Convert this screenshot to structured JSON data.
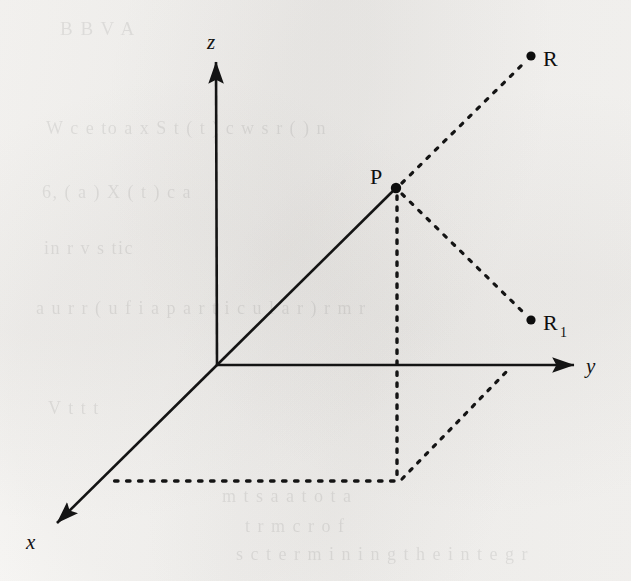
{
  "figure": {
    "background_color": "#f7f6f4",
    "ink_color": "#141414",
    "width": 631,
    "height": 581
  },
  "axes": [
    {
      "id": "z-axis",
      "label": "z",
      "style": "solid",
      "from": [
        217,
        365
      ],
      "to": [
        216,
        62
      ],
      "arrow": true,
      "label_pos": [
        207,
        48
      ]
    },
    {
      "id": "y-axis",
      "label": "y",
      "style": "solid",
      "from": [
        217,
        365
      ],
      "to": [
        575,
        365
      ],
      "arrow": true,
      "label_pos": [
        586,
        372
      ]
    },
    {
      "id": "x-axis",
      "label": "x",
      "style": "solid",
      "from": [
        217,
        365
      ],
      "to": [
        55,
        525
      ],
      "arrow": true,
      "label_pos": [
        26,
        548
      ]
    }
  ],
  "points": [
    {
      "id": "point-origin",
      "label": "",
      "pos": [
        217,
        365
      ],
      "dot": false
    },
    {
      "id": "point-p",
      "label": "P",
      "subscript": "",
      "pos": [
        396,
        188
      ],
      "dot": true,
      "label_pos": [
        372,
        184
      ]
    },
    {
      "id": "point-r",
      "label": "R",
      "subscript": "",
      "pos": [
        531,
        56
      ],
      "dot": true,
      "label_pos": [
        543,
        66
      ]
    },
    {
      "id": "point-r1",
      "label": "R",
      "subscript": "1",
      "pos": [
        531,
        320
      ],
      "dot": true,
      "label_pos": [
        543,
        330
      ]
    },
    {
      "id": "point-foot",
      "label": "",
      "pos": [
        398,
        481
      ],
      "dot": false
    },
    {
      "id": "point-y-foot",
      "label": "",
      "pos": [
        512,
        365
      ],
      "dot": false
    },
    {
      "id": "point-x-foot",
      "label": "",
      "pos": [
        104,
        481
      ],
      "dot": false
    }
  ],
  "segments": [
    {
      "id": "segment-origin-p",
      "style": "solid",
      "from": [
        217,
        365
      ],
      "to": [
        396,
        188
      ]
    },
    {
      "id": "segment-p-r",
      "style": "dotted",
      "from": [
        398,
        186
      ],
      "to": [
        528,
        59
      ]
    },
    {
      "id": "segment-p-r1",
      "style": "dotted",
      "from": [
        399,
        192
      ],
      "to": [
        528,
        317
      ]
    },
    {
      "id": "segment-p-foot",
      "style": "dotted",
      "from": [
        397,
        192
      ],
      "to": [
        397,
        481
      ]
    },
    {
      "id": "segment-foot-y",
      "style": "dotted",
      "from": [
        399,
        481
      ],
      "to": [
        512,
        366
      ]
    },
    {
      "id": "segment-foot-x",
      "style": "dotted",
      "from": [
        396,
        481
      ],
      "to": [
        104,
        481
      ]
    }
  ],
  "ghost_text": [
    {
      "text": "B  B      V     A",
      "pos": [
        60,
        18
      ],
      "size": 19
    },
    {
      "text": "W  c  e   to  a  x  S  t  ( t )     c  w  s  r ( )  n",
      "pos": [
        46,
        118
      ],
      "size": 18
    },
    {
      "text": "6,        ( a )         X       ( t )    c  a",
      "pos": [
        42,
        182
      ],
      "size": 18
    },
    {
      "text": "in            r  v  s                        tic",
      "pos": [
        44,
        238
      ],
      "size": 18
    },
    {
      "text": "a  u  r  r  ( u f i a  p a r t i c u l a r ) r  m  r",
      "pos": [
        36,
        298
      ],
      "size": 18
    },
    {
      "text": "V   t   t                                  t",
      "pos": [
        48,
        398
      ],
      "size": 18
    },
    {
      "text": "m t         s   a        a   t   o  t   a",
      "pos": [
        222,
        486
      ],
      "size": 18
    },
    {
      "text": "t   r  m   c  r   o f",
      "pos": [
        245,
        516
      ],
      "size": 18
    },
    {
      "text": "s c   t e r m i n i n g   t h e   i n t e g r",
      "pos": [
        236,
        544
      ],
      "size": 18
    }
  ]
}
